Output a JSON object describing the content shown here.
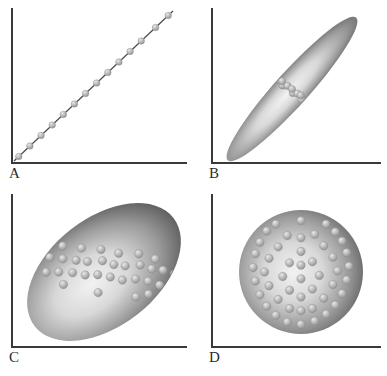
{
  "figure": {
    "background_color": "#ffffff",
    "axis_color": "#3a3a3a",
    "dot_color": "#b4b4b4",
    "dot_edge_color": "#8d8d8d",
    "cloud_dark_color": "#5a5a5a",
    "cloud_light_color": "#f2f2f2",
    "layout": "2x2 grid"
  },
  "panels": [
    {
      "id": "a",
      "label": "A",
      "shape": "line",
      "description": "Perfect positive linear relationship; markers lie exactly on the trend line",
      "correlation": 1.0,
      "correlation_text": "r = 1.0",
      "n_points": 14
    },
    {
      "id": "b",
      "label": "B",
      "shape": "narrow-ellipse",
      "description": "Strong positive linear relationship; narrow elongated cloud along the diagonal",
      "correlation": 0.9,
      "correlation_text": "r = 0.9",
      "tilt_degrees": -48,
      "n_points": 44
    },
    {
      "id": "c",
      "label": "C",
      "shape": "broad-ellipse",
      "description": "Moderate positive linear relationship; broad tilted elliptical cloud",
      "correlation": 0.6,
      "correlation_text": "r = 0.6",
      "tilt_degrees": -38,
      "n_points": 120
    },
    {
      "id": "d",
      "label": "D",
      "shape": "circle",
      "description": "No linear relationship; circular cloud of points",
      "correlation": 0.0,
      "correlation_text": "r = 0.0",
      "tilt_degrees": 0,
      "n_points": 130
    }
  ],
  "chart_data": {
    "type": "scatter",
    "xlabel": "",
    "ylabel": "",
    "grid": false,
    "legend": "none",
    "axes_style": "L-shaped spines, no tick labels",
    "series": [
      {
        "name": "A",
        "correlation": 1.0,
        "points": [
          [
            0.03,
            0.03
          ],
          [
            0.1,
            0.1
          ],
          [
            0.17,
            0.17
          ],
          [
            0.24,
            0.24
          ],
          [
            0.31,
            0.31
          ],
          [
            0.38,
            0.38
          ],
          [
            0.45,
            0.45
          ],
          [
            0.52,
            0.52
          ],
          [
            0.59,
            0.59
          ],
          [
            0.66,
            0.66
          ],
          [
            0.73,
            0.73
          ],
          [
            0.8,
            0.8
          ],
          [
            0.89,
            0.89
          ],
          [
            0.97,
            0.97
          ]
        ]
      },
      {
        "name": "B",
        "correlation": 0.9,
        "points": [
          [
            0.08,
            0.04
          ],
          [
            0.12,
            0.06
          ],
          [
            0.1,
            0.1
          ],
          [
            0.15,
            0.12
          ],
          [
            0.18,
            0.09
          ],
          [
            0.14,
            0.16
          ],
          [
            0.2,
            0.18
          ],
          [
            0.24,
            0.15
          ],
          [
            0.22,
            0.22
          ],
          [
            0.27,
            0.24
          ],
          [
            0.31,
            0.21
          ],
          [
            0.29,
            0.29
          ],
          [
            0.34,
            0.31
          ],
          [
            0.38,
            0.28
          ],
          [
            0.36,
            0.36
          ],
          [
            0.41,
            0.38
          ],
          [
            0.45,
            0.35
          ],
          [
            0.43,
            0.43
          ],
          [
            0.47,
            0.46
          ],
          [
            0.52,
            0.43
          ],
          [
            0.5,
            0.5
          ],
          [
            0.54,
            0.53
          ],
          [
            0.58,
            0.5
          ],
          [
            0.56,
            0.57
          ],
          [
            0.61,
            0.59
          ],
          [
            0.65,
            0.56
          ],
          [
            0.63,
            0.63
          ],
          [
            0.67,
            0.66
          ],
          [
            0.71,
            0.63
          ],
          [
            0.69,
            0.7
          ],
          [
            0.74,
            0.72
          ],
          [
            0.78,
            0.69
          ],
          [
            0.76,
            0.76
          ],
          [
            0.8,
            0.79
          ],
          [
            0.84,
            0.76
          ],
          [
            0.82,
            0.83
          ],
          [
            0.86,
            0.85
          ],
          [
            0.9,
            0.82
          ],
          [
            0.88,
            0.89
          ],
          [
            0.92,
            0.91
          ],
          [
            0.95,
            0.88
          ],
          [
            0.94,
            0.95
          ],
          [
            0.97,
            0.93
          ],
          [
            0.98,
            0.97
          ]
        ]
      },
      {
        "name": "C",
        "correlation": 0.6,
        "points": [
          [
            0.05,
            0.18
          ],
          [
            0.08,
            0.1
          ],
          [
            0.12,
            0.22
          ],
          [
            0.15,
            0.08
          ],
          [
            0.1,
            0.32
          ],
          [
            0.18,
            0.28
          ],
          [
            0.22,
            0.14
          ],
          [
            0.25,
            0.35
          ],
          [
            0.2,
            0.45
          ],
          [
            0.28,
            0.22
          ],
          [
            0.32,
            0.42
          ],
          [
            0.35,
            0.3
          ],
          [
            0.3,
            0.55
          ],
          [
            0.38,
            0.48
          ],
          [
            0.42,
            0.36
          ],
          [
            0.45,
            0.58
          ],
          [
            0.4,
            0.66
          ],
          [
            0.48,
            0.44
          ],
          [
            0.52,
            0.62
          ],
          [
            0.55,
            0.5
          ],
          [
            0.5,
            0.74
          ],
          [
            0.58,
            0.68
          ],
          [
            0.62,
            0.55
          ],
          [
            0.65,
            0.78
          ],
          [
            0.6,
            0.86
          ],
          [
            0.68,
            0.64
          ],
          [
            0.72,
            0.82
          ],
          [
            0.75,
            0.7
          ],
          [
            0.7,
            0.92
          ],
          [
            0.78,
            0.88
          ],
          [
            0.82,
            0.74
          ],
          [
            0.85,
            0.92
          ],
          [
            0.8,
            0.6
          ],
          [
            0.88,
            0.8
          ],
          [
            0.92,
            0.9
          ],
          [
            0.12,
            0.05
          ],
          [
            0.35,
            0.15
          ],
          [
            0.55,
            0.3
          ],
          [
            0.75,
            0.5
          ],
          [
            0.9,
            0.68
          ]
        ]
      },
      {
        "name": "D",
        "correlation": 0.0,
        "points": [
          [
            0.5,
            0.04
          ],
          [
            0.38,
            0.06
          ],
          [
            0.62,
            0.07
          ],
          [
            0.28,
            0.12
          ],
          [
            0.72,
            0.13
          ],
          [
            0.2,
            0.2
          ],
          [
            0.8,
            0.21
          ],
          [
            0.5,
            0.16
          ],
          [
            0.4,
            0.18
          ],
          [
            0.6,
            0.18
          ],
          [
            0.14,
            0.3
          ],
          [
            0.86,
            0.31
          ],
          [
            0.3,
            0.26
          ],
          [
            0.7,
            0.27
          ],
          [
            0.5,
            0.28
          ],
          [
            0.1,
            0.42
          ],
          [
            0.9,
            0.43
          ],
          [
            0.22,
            0.38
          ],
          [
            0.78,
            0.39
          ],
          [
            0.4,
            0.34
          ],
          [
            0.6,
            0.35
          ],
          [
            0.08,
            0.54
          ],
          [
            0.92,
            0.55
          ],
          [
            0.18,
            0.5
          ],
          [
            0.82,
            0.51
          ],
          [
            0.34,
            0.46
          ],
          [
            0.66,
            0.47
          ],
          [
            0.5,
            0.44
          ],
          [
            0.1,
            0.66
          ],
          [
            0.9,
            0.67
          ],
          [
            0.22,
            0.62
          ],
          [
            0.78,
            0.63
          ],
          [
            0.4,
            0.58
          ],
          [
            0.6,
            0.59
          ],
          [
            0.5,
            0.56
          ],
          [
            0.14,
            0.76
          ],
          [
            0.86,
            0.77
          ],
          [
            0.3,
            0.72
          ],
          [
            0.7,
            0.73
          ],
          [
            0.5,
            0.68
          ],
          [
            0.2,
            0.86
          ],
          [
            0.8,
            0.85
          ],
          [
            0.38,
            0.82
          ],
          [
            0.62,
            0.83
          ],
          [
            0.5,
            0.8
          ],
          [
            0.28,
            0.92
          ],
          [
            0.72,
            0.92
          ],
          [
            0.5,
            0.95
          ]
        ]
      }
    ]
  }
}
